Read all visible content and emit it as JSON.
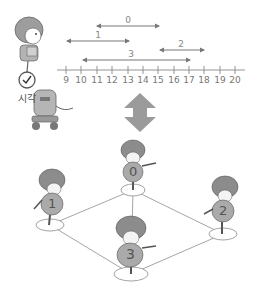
{
  "header": {
    "cut_off_caption": "· · · · · · · · · · · · ·"
  },
  "time_label": "시각",
  "axis": {
    "ticks": [
      "9",
      "10",
      "11",
      "12",
      "13",
      "14",
      "15",
      "16",
      "17",
      "18",
      "19",
      "20"
    ],
    "min": 9,
    "max": 20
  },
  "intervals": [
    {
      "label": "0",
      "start": 11,
      "end": 15
    },
    {
      "label": "1",
      "start": 9,
      "end": 13
    },
    {
      "label": "2",
      "start": 15,
      "end": 18
    },
    {
      "label": "3",
      "start": 10,
      "end": 17
    }
  ],
  "graph": {
    "nodes": [
      {
        "label": "0"
      },
      {
        "label": "1"
      },
      {
        "label": "2"
      },
      {
        "label": "3"
      }
    ],
    "edges": [
      [
        "0",
        "1"
      ],
      [
        "0",
        "2"
      ],
      [
        "0",
        "3"
      ],
      [
        "1",
        "3"
      ],
      [
        "2",
        "3"
      ]
    ]
  },
  "colors": {
    "line": "#8a8a8a",
    "arrow": "#9b9b9b",
    "figure": "#a9a9a9",
    "hair": "#8c8c8c"
  }
}
